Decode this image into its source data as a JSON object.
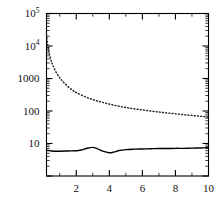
{
  "chart_data": {
    "type": "line",
    "title": "",
    "subtitle": "",
    "xlabel": "",
    "ylabel": "",
    "xscale": "linear",
    "yscale": "log",
    "xlim": [
      0.2,
      10
    ],
    "ylim": [
      1,
      100000
    ],
    "grid": false,
    "legend": null,
    "legend_position": "none",
    "x_ticks_major": [
      2,
      4,
      6,
      8,
      10
    ],
    "x_tick_labels": [
      "2",
      "4",
      "6",
      "8",
      "10"
    ],
    "x_ticks_minor": [
      1,
      3,
      5,
      7,
      9
    ],
    "y_ticks_major": [
      10,
      100,
      1000,
      10000,
      100000
    ],
    "y_tick_labels": [
      "10",
      "100",
      "1000",
      "10⁴",
      "10⁵"
    ],
    "y_tick_label_parts": [
      {
        "base": "10",
        "exp": ""
      },
      {
        "base": "100",
        "exp": ""
      },
      {
        "base": "1000",
        "exp": ""
      },
      {
        "base": "10",
        "exp": "4"
      },
      {
        "base": "10",
        "exp": "5"
      }
    ],
    "series": [
      {
        "name": "dotted-curve",
        "style": "dotted",
        "color": "#2a2a2a",
        "x": [
          0.2,
          0.3,
          0.4,
          0.5,
          0.6,
          0.8,
          1.0,
          1.2,
          1.5,
          1.8,
          2.0,
          2.5,
          3.0,
          3.5,
          4.0,
          4.5,
          5.0,
          5.5,
          6.0,
          6.5,
          7.0,
          7.5,
          8.0,
          8.5,
          9.0,
          9.5,
          10.0
        ],
        "y": [
          22000,
          9000,
          5000,
          3300,
          2400,
          1500,
          1050,
          800,
          560,
          430,
          370,
          280,
          225,
          190,
          163,
          143,
          128,
          117,
          108,
          100,
          93,
          87,
          82,
          77,
          73,
          69,
          65
        ]
      },
      {
        "name": "solid-curve",
        "style": "solid",
        "color": "#000000",
        "x": [
          0.2,
          0.5,
          1.0,
          1.5,
          2.0,
          2.3,
          2.6,
          3.0,
          3.3,
          3.6,
          4.0,
          4.3,
          4.6,
          5.0,
          5.5,
          6.0,
          6.5,
          7.0,
          7.5,
          8.0,
          8.5,
          9.0,
          9.5,
          10.0
        ],
        "y": [
          6.2,
          5.9,
          5.8,
          5.9,
          6.0,
          6.3,
          7.0,
          7.6,
          6.8,
          5.8,
          5.2,
          5.5,
          6.1,
          6.5,
          6.7,
          6.8,
          6.9,
          7.0,
          7.0,
          7.1,
          7.1,
          7.2,
          7.3,
          7.4
        ]
      }
    ]
  }
}
